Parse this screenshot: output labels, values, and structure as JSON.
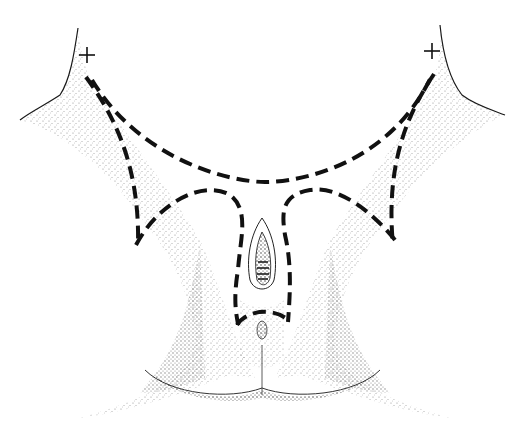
{
  "figure": {
    "type": "anatomical-illustration",
    "style": "stipple drawing with dashed incision outlines",
    "background": "#ffffff",
    "ink_color": "#111111",
    "markers": [
      {
        "name": "left-plus-marker",
        "glyph": "+",
        "x": 87,
        "y": 55
      },
      {
        "name": "right-plus-marker",
        "glyph": "+",
        "x": 432,
        "y": 51
      }
    ],
    "dashed_lines": [
      {
        "name": "upper-arc-incision",
        "d": "M 92 80 C 140 160, 230 182, 265 182 C 300 182, 390 165, 432 75"
      },
      {
        "name": "left-outer-incision",
        "d": "M 86 77 C 110 110, 140 160, 138 245"
      },
      {
        "name": "right-outer-incision",
        "d": "M 434 74 C 410 110, 385 160, 393 245"
      },
      {
        "name": "left-inner-flap-incision",
        "d": "M 136 245 C 160 200, 205 180, 230 195 C 250 210, 240 240, 238 270 C 232 305, 238 320, 238 325"
      },
      {
        "name": "right-inner-flap-incision",
        "d": "M 395 240 C 375 215, 340 185, 310 190 C 280 195, 282 215, 285 235 C 292 265, 290 295, 288 322"
      },
      {
        "name": "lower-arc-incision",
        "d": "M 237 325 C 248 308, 278 308, 290 322"
      }
    ]
  }
}
